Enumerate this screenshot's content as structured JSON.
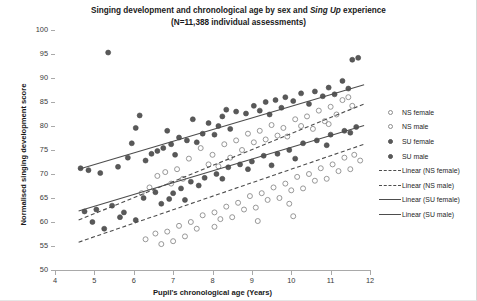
{
  "chart_data": {
    "type": "scatter",
    "title": "Singing development and chronological age by sex and Sing Up experience",
    "title_line1_pre": "Singing development and chronological age by sex and ",
    "title_line1_em": "Sing Up",
    "title_line1_post": " experience",
    "subtitle": "(N=11,388 individual assessments)",
    "xlabel": "Pupil's chronological age (Years)",
    "ylabel": "Normalised singing development score",
    "xlim": [
      4,
      12
    ],
    "ylim": [
      50,
      100
    ],
    "xticks": [
      4,
      5,
      6,
      7,
      8,
      9,
      10,
      11,
      12
    ],
    "yticks": [
      50,
      55,
      60,
      65,
      70,
      75,
      80,
      85,
      90,
      95,
      100
    ],
    "grid": false,
    "legend_position": "right",
    "marker_colors": {
      "ns_female": "#8c8c8c",
      "ns_male": "#8c8c8c",
      "su_female": "#595959",
      "su_male": "#595959",
      "line": "#4d4d4d"
    },
    "legend": [
      {
        "label": "NS female",
        "key": "open-circle-marker",
        "style": "open"
      },
      {
        "label": "NS male",
        "key": "open-circle-marker",
        "style": "open"
      },
      {
        "label": "SU female",
        "key": "filled-circle-marker",
        "style": "filled"
      },
      {
        "label": "SU male",
        "key": "filled-circle-marker",
        "style": "filled"
      },
      {
        "label": "Linear (NS female)",
        "key": "dashed-line",
        "style": "dashed"
      },
      {
        "label": "Linear (NS male)",
        "key": "dashed-line",
        "style": "dashed"
      },
      {
        "label": "Linear (SU female)",
        "key": "solid-line",
        "style": "solid"
      },
      {
        "label": "Linear (SU male)",
        "key": "solid-line",
        "style": "solid"
      }
    ],
    "trendlines": [
      {
        "name": "Linear (SU female)",
        "style": "solid",
        "x": [
          4.6,
          11.85
        ],
        "y": [
          71.0,
          88.6
        ]
      },
      {
        "name": "Linear (SU male)",
        "style": "solid",
        "x": [
          4.6,
          11.85
        ],
        "y": [
          62.3,
          80.1
        ]
      },
      {
        "name": "Linear (NS female)",
        "style": "dashed",
        "x": [
          4.6,
          11.85
        ],
        "y": [
          60.4,
          84.6
        ]
      },
      {
        "name": "Linear (NS male)",
        "style": "dashed",
        "x": [
          4.6,
          11.85
        ],
        "y": [
          55.8,
          76.2
        ]
      }
    ],
    "series": [
      {
        "name": "SU female",
        "marker": "filled",
        "points": [
          [
            5.35,
            95.3
          ],
          [
            6.15,
            82.2
          ],
          [
            6.05,
            79.6
          ],
          [
            5.95,
            76.4
          ],
          [
            7.5,
            81.4
          ],
          [
            7.9,
            80.6
          ],
          [
            8.25,
            82.0
          ],
          [
            8.35,
            83.4
          ],
          [
            8.05,
            78.2
          ],
          [
            7.15,
            77.6
          ],
          [
            6.75,
            75.4
          ],
          [
            6.45,
            74.2
          ],
          [
            9.05,
            84.2
          ],
          [
            9.35,
            85.0
          ],
          [
            9.6,
            85.4
          ],
          [
            9.85,
            86.0
          ],
          [
            10.25,
            86.8
          ],
          [
            10.6,
            87.2
          ],
          [
            10.95,
            88.0
          ],
          [
            11.3,
            89.4
          ],
          [
            11.55,
            93.8
          ],
          [
            11.7,
            94.2
          ],
          [
            11.45,
            87.8
          ],
          [
            7.75,
            78.4
          ],
          [
            8.6,
            83.0
          ],
          [
            8.85,
            82.6
          ],
          [
            9.2,
            83.2
          ],
          [
            6.95,
            76.2
          ],
          [
            7.35,
            77.0
          ],
          [
            5.6,
            71.5
          ],
          [
            5.15,
            70.2
          ],
          [
            4.85,
            70.8
          ],
          [
            4.65,
            71.2
          ],
          [
            6.3,
            72.8
          ],
          [
            6.6,
            74.8
          ],
          [
            9.45,
            82.4
          ],
          [
            10.05,
            85.2
          ],
          [
            10.45,
            84.6
          ],
          [
            10.8,
            86.2
          ],
          [
            8.15,
            80.0
          ],
          [
            7.05,
            74.0
          ],
          [
            5.85,
            73.4
          ],
          [
            6.85,
            79.0
          ],
          [
            9.75,
            83.8
          ],
          [
            11.1,
            86.6
          ],
          [
            8.45,
            79.4
          ],
          [
            7.6,
            76.6
          ]
        ]
      },
      {
        "name": "SU male",
        "marker": "filled",
        "points": [
          [
            4.75,
            62.2
          ],
          [
            5.05,
            62.6
          ],
          [
            5.45,
            63.4
          ],
          [
            5.75,
            62.0
          ],
          [
            6.25,
            65.0
          ],
          [
            6.55,
            66.2
          ],
          [
            6.9,
            64.8
          ],
          [
            7.2,
            67.0
          ],
          [
            7.45,
            68.4
          ],
          [
            7.8,
            69.2
          ],
          [
            8.1,
            70.0
          ],
          [
            8.4,
            71.4
          ],
          [
            8.7,
            72.0
          ],
          [
            9.0,
            72.6
          ],
          [
            9.3,
            73.8
          ],
          [
            9.65,
            74.2
          ],
          [
            9.95,
            75.0
          ],
          [
            10.3,
            76.4
          ],
          [
            10.65,
            77.0
          ],
          [
            11.0,
            78.2
          ],
          [
            11.35,
            79.0
          ],
          [
            11.65,
            79.8
          ],
          [
            6.05,
            60.4
          ],
          [
            5.25,
            58.6
          ],
          [
            7.0,
            66.0
          ],
          [
            7.65,
            67.6
          ],
          [
            8.9,
            71.0
          ],
          [
            10.1,
            73.2
          ],
          [
            10.9,
            76.0
          ],
          [
            11.5,
            78.6
          ],
          [
            6.7,
            63.8
          ],
          [
            8.25,
            69.0
          ],
          [
            9.5,
            71.8
          ],
          [
            4.95,
            60.0
          ],
          [
            5.65,
            61.0
          ],
          [
            7.3,
            64.6
          ]
        ]
      },
      {
        "name": "NS female",
        "marker": "open",
        "points": [
          [
            6.6,
            69.6
          ],
          [
            6.8,
            70.4
          ],
          [
            7.1,
            71.0
          ],
          [
            7.4,
            73.2
          ],
          [
            7.7,
            75.4
          ],
          [
            8.0,
            74.0
          ],
          [
            8.3,
            76.2
          ],
          [
            8.6,
            77.0
          ],
          [
            8.9,
            78.4
          ],
          [
            9.2,
            79.0
          ],
          [
            9.5,
            80.2
          ],
          [
            9.8,
            79.6
          ],
          [
            10.1,
            81.4
          ],
          [
            10.4,
            82.0
          ],
          [
            10.7,
            83.2
          ],
          [
            11.0,
            84.0
          ],
          [
            11.3,
            85.4
          ],
          [
            11.55,
            84.2
          ],
          [
            6.4,
            67.2
          ],
          [
            6.2,
            66.0
          ],
          [
            7.9,
            72.0
          ],
          [
            8.45,
            73.4
          ],
          [
            9.05,
            76.6
          ],
          [
            9.65,
            78.0
          ],
          [
            10.25,
            80.0
          ],
          [
            10.85,
            81.0
          ],
          [
            11.15,
            82.4
          ],
          [
            7.25,
            69.0
          ],
          [
            8.75,
            75.0
          ],
          [
            9.35,
            77.2
          ],
          [
            10.55,
            79.4
          ],
          [
            11.45,
            86.0
          ],
          [
            6.95,
            68.0
          ],
          [
            8.15,
            71.6
          ],
          [
            9.9,
            77.8
          ],
          [
            10.95,
            80.4
          ]
        ]
      },
      {
        "name": "NS male",
        "marker": "open",
        "points": [
          [
            6.55,
            57.6
          ],
          [
            6.85,
            58.0
          ],
          [
            7.15,
            59.2
          ],
          [
            7.45,
            60.0
          ],
          [
            7.75,
            61.4
          ],
          [
            8.05,
            62.0
          ],
          [
            8.35,
            63.2
          ],
          [
            8.65,
            64.0
          ],
          [
            8.95,
            65.4
          ],
          [
            9.25,
            66.0
          ],
          [
            9.55,
            67.2
          ],
          [
            9.85,
            68.0
          ],
          [
            10.15,
            69.4
          ],
          [
            10.45,
            70.0
          ],
          [
            10.75,
            71.2
          ],
          [
            11.05,
            72.0
          ],
          [
            11.35,
            73.4
          ],
          [
            11.6,
            74.0
          ],
          [
            6.3,
            56.4
          ],
          [
            7.0,
            56.0
          ],
          [
            7.6,
            58.6
          ],
          [
            8.2,
            60.6
          ],
          [
            8.8,
            62.6
          ],
          [
            9.4,
            64.6
          ],
          [
            10.0,
            66.6
          ],
          [
            10.6,
            68.6
          ],
          [
            11.2,
            70.6
          ],
          [
            7.3,
            57.0
          ],
          [
            8.5,
            61.0
          ],
          [
            9.7,
            65.0
          ],
          [
            10.9,
            69.0
          ],
          [
            11.5,
            71.0
          ],
          [
            9.1,
            63.0
          ],
          [
            6.7,
            55.4
          ],
          [
            10.3,
            67.0
          ],
          [
            8.05,
            59.0
          ],
          [
            9.95,
            63.8
          ],
          [
            11.75,
            72.8
          ],
          [
            10.05,
            61.2
          ],
          [
            9.15,
            60.2
          ]
        ]
      }
    ]
  }
}
